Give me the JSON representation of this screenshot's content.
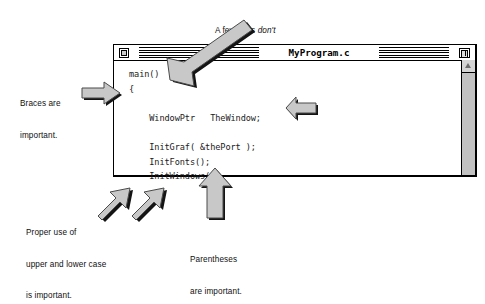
{
  "window": {
    "title": "MyProgram.c",
    "close_box": "close-box",
    "zoom_box": "zoom-box",
    "scroll_up": "scroll-up-arrow",
    "code_lines": [
      "main()",
      "{",
      "",
      "    WindowPtr   TheWindow;",
      "",
      "    InitGraf( &thePort );",
      "    InitFonts();",
      "    InitWindows();"
    ],
    "code_text": "main()\n{\n\n    WindowPtr   TheWindow;\n\n    InitGraf( &thePort );\n    InitFonts();\n    InitWindows();"
  },
  "annotations": {
    "semicolon_top": {
      "line1_a": "A few lines ",
      "line1_em": "don't",
      "line2": "end with a semicolon."
    },
    "braces": {
      "line1": "Braces are",
      "line2": "important."
    },
    "semicolon_right": {
      "line1_a": "Most lines ",
      "line1_em": "do",
      "line2": "end with a semicolon"
    },
    "case": {
      "line1": "Proper use of",
      "line2": "upper and lower case",
      "line3": "is important."
    },
    "parens": {
      "line1": "Parentheses",
      "line2": "are important."
    }
  },
  "colors": {
    "arrow_fill": "#c8c8c8",
    "arrow_stroke": "#3a3a3a",
    "arrow_shadow": "#141414",
    "window_bg": "#ffffff",
    "scroll_track": "#c2c2c2",
    "text": "#0f0f0f"
  }
}
